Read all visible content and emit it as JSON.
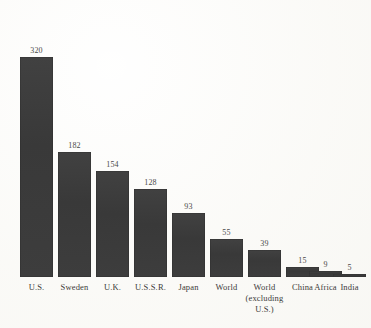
{
  "chart_data": {
    "type": "bar",
    "title": "",
    "subtitle": "",
    "xlabel": "",
    "ylabel": "",
    "ylim": [
      0,
      320
    ],
    "grid": false,
    "legend": null,
    "axis_visible": false,
    "value_labels_shown": true,
    "categories": [
      "U.S.",
      "Sweden",
      "U.K.",
      "U.S.S.R.",
      "Japan",
      "World",
      "World\n(excluding\nU.S.)",
      "China",
      "Africa",
      "India"
    ],
    "values": [
      320,
      182,
      154,
      128,
      93,
      55,
      39,
      15,
      9,
      5
    ],
    "value_label_text": [
      "320",
      "182",
      "154",
      "128",
      "93",
      "55",
      "39",
      "15",
      "9",
      "5"
    ],
    "colors": {
      "bar": "#3b3b3b",
      "background": "#fbfbf9",
      "text": "#3c3b39"
    }
  }
}
